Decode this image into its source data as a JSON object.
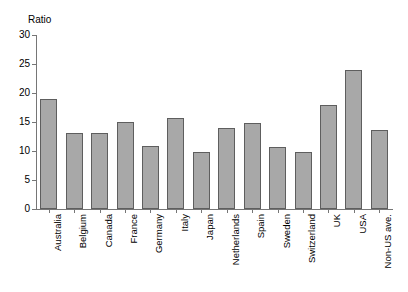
{
  "chart_data": {
    "type": "bar",
    "title": "",
    "ylabel": "Ratio",
    "xlabel": "",
    "ylim": [
      0,
      30
    ],
    "yticks": [
      0,
      5,
      10,
      15,
      20,
      25,
      30
    ],
    "ytick_labels": [
      "0",
      "5",
      "10",
      "15",
      "20",
      "25",
      "30"
    ],
    "grid": false,
    "legend": false,
    "bar_color": "#a8a8a8",
    "bar_edge_color": "#5e5e5e",
    "axis_color": "#767676",
    "categories": [
      "Australia",
      "Belgium",
      "Canada",
      "France",
      "Germany",
      "Italy",
      "Japan",
      "Netherlands",
      "Spain",
      "Sweden",
      "Switzerland",
      "UK",
      "USA",
      "Non-US ave."
    ],
    "values": [
      19.0,
      13.1,
      13.1,
      15.0,
      10.9,
      15.7,
      9.8,
      14.0,
      14.8,
      10.7,
      9.8,
      17.9,
      24.0,
      13.7
    ]
  }
}
